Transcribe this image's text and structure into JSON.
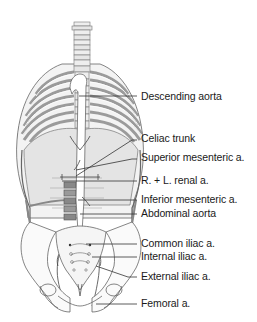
{
  "diagram": {
    "type": "anatomical-illustration",
    "colors": {
      "background": "#ffffff",
      "line": "#333333",
      "text": "#1a1a1a",
      "bone_fill": "#e6e6e6",
      "rib_shade": "#8c8c8c",
      "organ_fill": "#d9d9d9"
    },
    "labels": [
      {
        "id": "descending-aorta",
        "text": "Descending aorta",
        "y": 96
      },
      {
        "id": "celiac-trunk",
        "text": "Celiac trunk",
        "y": 138
      },
      {
        "id": "superior-mesenteric",
        "text": "Superior mesenteric a.",
        "y": 157
      },
      {
        "id": "renal",
        "text": "R. + L. renal a.",
        "y": 180
      },
      {
        "id": "inferior-mesenteric",
        "text": "Inferior mesenteric a.",
        "y": 199
      },
      {
        "id": "abdominal-aorta",
        "text": "Abdominal aorta",
        "y": 213
      },
      {
        "id": "common-iliac",
        "text": "Common iliac a.",
        "y": 243
      },
      {
        "id": "internal-iliac",
        "text": "Internal iliac a.",
        "y": 256
      },
      {
        "id": "external-iliac",
        "text": "External iliac a.",
        "y": 276
      },
      {
        "id": "femoral",
        "text": "Femoral a.",
        "y": 303
      }
    ]
  }
}
